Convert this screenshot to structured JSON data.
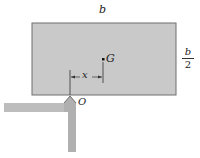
{
  "diagram": {
    "type": "statics-figure",
    "labels": {
      "width": "b",
      "height_numerator": "b",
      "height_denominator": "2",
      "center_of_gravity": "G",
      "offset": "x",
      "pivot": "O"
    },
    "colors": {
      "block_fill": "#c8c8c8",
      "block_edge": "#6e6e6e",
      "support_fill": "#b4b4b4",
      "line": "#333333"
    }
  }
}
